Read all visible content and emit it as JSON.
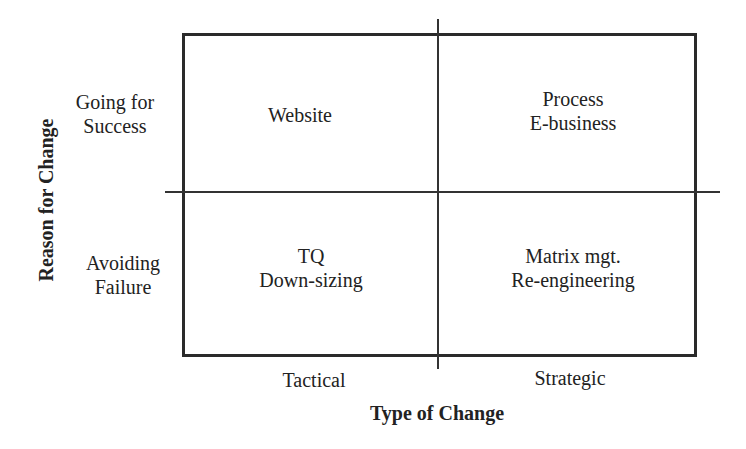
{
  "diagram": {
    "type": "2x2 matrix",
    "axes": {
      "x_title": "Type of Change",
      "y_title": "Reason for Change",
      "columns": [
        {
          "label": "Tactical"
        },
        {
          "label": "Strategic"
        }
      ],
      "rows": [
        {
          "line1": "Going for",
          "line2": "Success"
        },
        {
          "line1": "Avoiding",
          "line2": "Failure"
        }
      ]
    },
    "quadrants": {
      "top_left": {
        "line1": "Website",
        "line2": ""
      },
      "top_right": {
        "line1": "Process",
        "line2": "E-business"
      },
      "bottom_left": {
        "line1": "TQ",
        "line2": "Down-sizing"
      },
      "bottom_right": {
        "line1": "Matrix mgt.",
        "line2": "Re-engineering"
      }
    }
  }
}
